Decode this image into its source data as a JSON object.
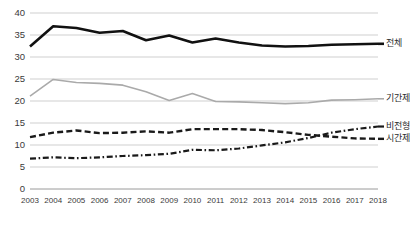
{
  "chart_data": {
    "type": "line",
    "title": "",
    "xlabel": "",
    "ylabel": "",
    "ylim": [
      0,
      40
    ],
    "ytick_step": 5,
    "grid": true,
    "legend_position": "right",
    "categories": [
      "2003",
      "2004",
      "2005",
      "2006",
      "2007",
      "2008",
      "2009",
      "2010",
      "2011",
      "2012",
      "2013",
      "2014",
      "2015",
      "2016",
      "2017",
      "2018"
    ],
    "yticks": [
      "0",
      "5",
      "10",
      "15",
      "20",
      "25",
      "30",
      "35",
      "40"
    ],
    "series": [
      {
        "name": "전체",
        "style": "solid-thick",
        "color": "#111111",
        "values": [
          32.4,
          37.0,
          36.6,
          35.5,
          35.9,
          33.8,
          34.9,
          33.3,
          34.2,
          33.3,
          32.6,
          32.4,
          32.5,
          32.8,
          32.9,
          33.0
        ]
      },
      {
        "name": "기간제",
        "style": "solid-thin",
        "color": "#aaaaaa",
        "values": [
          21.1,
          24.9,
          24.2,
          24.0,
          23.6,
          22.1,
          20.1,
          21.7,
          19.9,
          19.8,
          19.6,
          19.4,
          19.6,
          20.2,
          20.3,
          20.5
        ]
      },
      {
        "name": "시간제",
        "style": "dashed",
        "color": "#1a1a1a",
        "values": [
          11.8,
          12.8,
          13.3,
          12.7,
          12.8,
          13.1,
          12.8,
          13.6,
          13.6,
          13.6,
          13.4,
          12.9,
          12.3,
          11.9,
          11.5,
          11.4
        ]
      },
      {
        "name": "비전형",
        "style": "dash-dot",
        "color": "#1a1a1a",
        "values": [
          6.9,
          7.2,
          7.0,
          7.2,
          7.5,
          7.7,
          8.0,
          8.9,
          8.8,
          9.2,
          9.9,
          10.6,
          11.6,
          12.8,
          13.6,
          14.2
        ]
      }
    ]
  },
  "legend": {
    "items": [
      {
        "label": "전체"
      },
      {
        "label": "기간제"
      },
      {
        "label": "시간제"
      },
      {
        "label": "비전형"
      }
    ]
  }
}
